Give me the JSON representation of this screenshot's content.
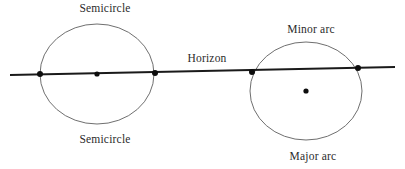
{
  "figure": {
    "background_color": "#ffffff",
    "width": 405,
    "height": 169,
    "labels": {
      "horizon": "Horizon",
      "left_top": "Semicircle",
      "left_bottom": "Semicircle",
      "right_top": "Minor arc",
      "right_bottom": "Major arc"
    },
    "colors": {
      "circle_stroke": "#6f6f6f",
      "line_stroke": "#1a1a1a",
      "dot_fill": "#0d0d0d",
      "text": "#2b2b2b"
    }
  },
  "chart_data": {
    "type": "diagram",
    "horizon": {
      "label": "Horizon",
      "x1": 10,
      "y1": 75,
      "x2": 395,
      "y2": 67,
      "label_x": 207,
      "label_y": 62
    },
    "circles": [
      {
        "name": "left-circle",
        "cx": 97,
        "cy": 74,
        "rx": 57,
        "ry": 50,
        "line_through_center": true,
        "arc_above_label": "Semicircle",
        "arc_below_label": "Semicircle",
        "label_above_x": 105,
        "label_above_y": 12,
        "label_below_x": 105,
        "label_below_y": 143,
        "center_dot": {
          "x": 97,
          "y": 74,
          "r": 2.6
        },
        "intersections": [
          {
            "x": 40,
            "y": 74,
            "r": 3.0
          },
          {
            "x": 155,
            "y": 73,
            "r": 3.0
          }
        ]
      },
      {
        "name": "right-circle",
        "cx": 306,
        "cy": 91,
        "rx": 56,
        "ry": 49,
        "line_through_center": false,
        "arc_above_label": "Minor arc",
        "arc_below_label": "Major arc",
        "label_above_x": 311,
        "label_above_y": 33,
        "label_below_x": 313,
        "label_below_y": 160,
        "center_dot": {
          "x": 306,
          "y": 91,
          "r": 2.6
        },
        "intersections": [
          {
            "x": 252,
            "y": 72,
            "r": 3.0
          },
          {
            "x": 358,
            "y": 68,
            "r": 3.0
          }
        ]
      }
    ]
  }
}
